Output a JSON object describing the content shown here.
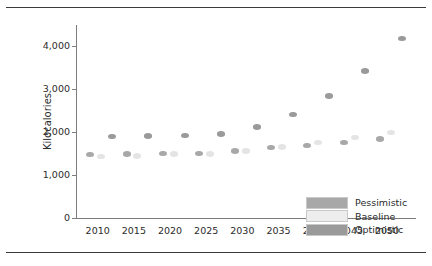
{
  "chart_data": {
    "type": "scatter",
    "title": "",
    "xlabel": "",
    "ylabel": "Kilocalories",
    "xlim": [
      2007,
      2054
    ],
    "ylim": [
      0,
      4500
    ],
    "yticks": [
      0,
      1000,
      2000,
      3000,
      4000
    ],
    "ytick_labels": [
      "0",
      "1,000",
      "2,000",
      "3,000",
      "4,000"
    ],
    "xticks": [
      2010,
      2015,
      2020,
      2025,
      2030,
      2035,
      2040,
      2045,
      2050
    ],
    "xtick_labels": [
      "2010",
      "2015",
      "2020",
      "2025",
      "2030",
      "2035",
      "2040",
      "2045",
      "2050"
    ],
    "grid": false,
    "legend_position": "bottom-right",
    "series": [
      {
        "name": "Pessimistic",
        "color": "#a8a8a8",
        "x": [
          2009,
          2014,
          2019,
          2024,
          2029,
          2034,
          2039,
          2044,
          2049
        ],
        "values": [
          1480,
          1490,
          1500,
          1500,
          1560,
          1640,
          1690,
          1760,
          1840
        ]
      },
      {
        "name": "Baseline",
        "color": "#ededed",
        "x": [
          2010.5,
          2015.5,
          2020.5,
          2025.5,
          2030.5,
          2035.5,
          2040.5,
          2045.5,
          2050.5
        ],
        "values": [
          1430,
          1450,
          1490,
          1490,
          1560,
          1660,
          1760,
          1880,
          1990
        ]
      },
      {
        "name": "Optimistic",
        "color": "#9a9a9a",
        "x": [
          2012,
          2017,
          2022,
          2027,
          2032,
          2037,
          2042,
          2047,
          2052
        ],
        "values": [
          1900,
          1910,
          1920,
          1960,
          2120,
          2410,
          2850,
          3430,
          4180
        ]
      }
    ]
  },
  "legend": {
    "items": [
      {
        "label": "Pessimistic",
        "swatch": "pess"
      },
      {
        "label": "Baseline",
        "swatch": "base"
      },
      {
        "label": "Optimistic",
        "swatch": "opti"
      }
    ]
  }
}
